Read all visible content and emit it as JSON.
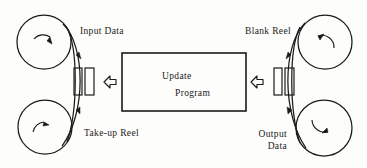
{
  "diagram": {
    "ink_color": "#1b1b1b",
    "background_color": "#fdfdfb",
    "process_box": {
      "label_line1": "Update",
      "label_line2": "Program",
      "x": 122,
      "y": 53,
      "width": 124,
      "height": 58
    },
    "reels": [
      {
        "name": "input-data-reel",
        "label": "Input Data",
        "cx": 44,
        "cy": 42,
        "r": 27,
        "spin": "clockwise"
      },
      {
        "name": "take-up-reel",
        "label": "Take-up Reel",
        "cx": 45,
        "cy": 127,
        "r": 27,
        "spin": "clockwise"
      },
      {
        "name": "blank-reel",
        "label": "Blank Reel",
        "cx": 325,
        "cy": 42,
        "r": 27,
        "spin": "counter-clockwise"
      },
      {
        "name": "output-data-reel",
        "label_line1": "Output",
        "label_line2": "Data",
        "cx": 324,
        "cy": 128,
        "r": 28,
        "spin": "clockwise"
      }
    ],
    "tape_heads": [
      {
        "name": "left-head-1",
        "x": 74,
        "y": 68,
        "width": 8,
        "height": 27
      },
      {
        "name": "left-head-2",
        "x": 85,
        "y": 68,
        "width": 9,
        "height": 27
      },
      {
        "name": "right-head-1",
        "x": 274,
        "y": 68,
        "width": 8,
        "height": 27
      },
      {
        "name": "right-head-2",
        "x": 285,
        "y": 68,
        "width": 9,
        "height": 27
      }
    ],
    "flow_arrows": [
      {
        "name": "left-flow-arrow",
        "direction": "left",
        "x": 104,
        "y": 76
      },
      {
        "name": "right-flow-arrow",
        "direction": "left",
        "x": 251,
        "y": 76
      }
    ]
  }
}
